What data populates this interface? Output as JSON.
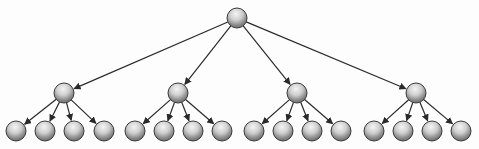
{
  "diagram": {
    "type": "tree",
    "levels": 3,
    "branching_factor": 4,
    "colors": {
      "edge": "#2a2a2a",
      "node_outline": "#3a3a3a",
      "node_highlight": "#f4f4f4",
      "node_mid": "#bdbdbd",
      "node_shadow": "#6e6e6e",
      "background": "#fdfdfd"
    },
    "node_radius": 10,
    "root": {
      "id": "root",
      "x": 237,
      "y": 18
    },
    "children": [
      {
        "id": "mid-1",
        "x": 64,
        "y": 93,
        "leaves": [
          16,
          45,
          74,
          104
        ]
      },
      {
        "id": "mid-2",
        "x": 178,
        "y": 93,
        "leaves": [
          135,
          164,
          193,
          222
        ]
      },
      {
        "id": "mid-3",
        "x": 297,
        "y": 93,
        "leaves": [
          254,
          283,
          312,
          341
        ]
      },
      {
        "id": "mid-4",
        "x": 416,
        "y": 93,
        "leaves": [
          374,
          403,
          432,
          461
        ]
      }
    ],
    "leaf_y": 131
  }
}
